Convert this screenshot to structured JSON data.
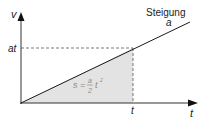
{
  "diagram": {
    "axes": {
      "y_label": "v",
      "x_label": "t"
    },
    "tick_labels": {
      "y_tick": "at",
      "x_tick": "t"
    },
    "line_annotation": {
      "word": "Steigung",
      "symbol": "a"
    },
    "area_formula": {
      "lhs": "s =",
      "numerator": "a",
      "denominator": "2",
      "var": "t",
      "exponent": "2"
    },
    "colors": {
      "line": "#1a1a1a",
      "area_fill": "#e3e3e3",
      "dashed": "#555555",
      "formula": "#8a8a8a"
    }
  }
}
